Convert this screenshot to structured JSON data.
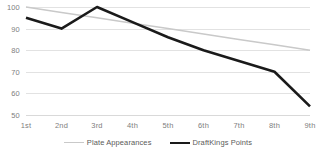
{
  "chart_data": {
    "type": "line",
    "title": "",
    "xlabel": "",
    "ylabel": "",
    "categories": [
      "1st",
      "2nd",
      "3rd",
      "4th",
      "5th",
      "6th",
      "7th",
      "8th",
      "9th"
    ],
    "series": [
      {
        "name": "Plate Appearances",
        "color": "#c9c9c9",
        "width": 1.5,
        "values": [
          100,
          97.5,
          95,
          92.5,
          90,
          87.5,
          85,
          82.5,
          80
        ]
      },
      {
        "name": "DraftKings Points",
        "color": "#1a1a1a",
        "width": 2.6,
        "values": [
          95,
          90,
          100,
          93,
          86,
          80,
          75,
          70,
          54
        ]
      }
    ],
    "ylim": [
      50,
      100
    ],
    "yticks": [
      100,
      90,
      80,
      70,
      60,
      50
    ],
    "ytick_labels": [
      "100",
      "90",
      "80",
      "70",
      "60",
      "50"
    ],
    "grid": true,
    "legend_position": "bottom",
    "background_color": "#ffffff",
    "gridline_color": "#e2e2e2",
    "tick_label_color": "#808080"
  }
}
